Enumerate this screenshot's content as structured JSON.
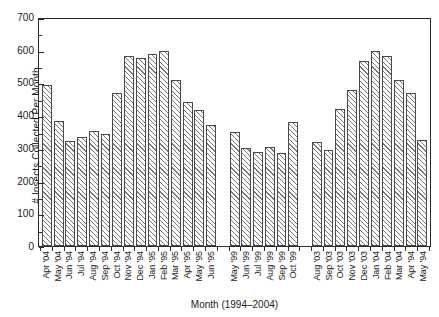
{
  "chart_data": {
    "type": "bar",
    "title": "",
    "xlabel": "Month (1994–2004)",
    "ylabel": "# Insects Collected Per Month",
    "ylim": [
      0,
      700
    ],
    "ytick_labels": [
      "0",
      "100",
      "200",
      "300",
      "400",
      "500",
      "600",
      "700"
    ],
    "ytick_values": [
      0,
      100,
      200,
      300,
      400,
      500,
      600,
      700
    ],
    "yminor_values": [
      50,
      150,
      250,
      350,
      450,
      550,
      650
    ],
    "grid": false,
    "legend": null,
    "bar_style": {
      "fill": "diagonal-hatch",
      "edge_color": "#4a4a4a",
      "hatch_color": "#777777",
      "face_color": "#ffffff"
    },
    "categories": [
      "Apr '04",
      "May '04",
      "Jun '94",
      "Jul '94",
      "Aug '94",
      "Sep '94",
      "Oct '94",
      "Nov '94",
      "Dec '94",
      "Jan '95",
      "Feb '95",
      "Mar '95",
      "Apr '95",
      "May '95",
      "Jun '95",
      "",
      "May '99",
      "Jun '99",
      "Jul '99",
      "Aug '99",
      "Sep '99",
      "Oct '99",
      "",
      "Aug '03",
      "Sep '03",
      "Oct '03",
      "Nov '03",
      "Dec '03",
      "Jan '04",
      "Feb '04",
      "Mar '04",
      "Apr '94",
      "May '94"
    ],
    "values": [
      492,
      383,
      322,
      332,
      352,
      342,
      467,
      580,
      574,
      586,
      595,
      506,
      441,
      415,
      370,
      null,
      350,
      300,
      288,
      303,
      285,
      378,
      null,
      318,
      292,
      420,
      478,
      565,
      597,
      582,
      507,
      467,
      323
    ]
  }
}
